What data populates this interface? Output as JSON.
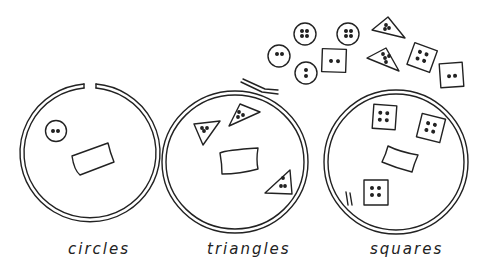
{
  "diagram": {
    "title": "",
    "rings": [
      {
        "id": "circles",
        "label": "circles",
        "contents": [
          "circle button (2 holes)",
          "blank card"
        ],
        "ring_state": "open gap at top"
      },
      {
        "id": "triangles",
        "label": "triangles",
        "contents": [
          "triangle button (3 holes)",
          "triangle button (3 holes)",
          "triangle button (3 holes)",
          "blank card"
        ],
        "ring_state": "overlapping ends at top"
      },
      {
        "id": "squares",
        "label": "squares",
        "contents": [
          "square button (4 holes)",
          "square button (4 holes)",
          "square button (4 holes)",
          "blank card"
        ],
        "ring_state": "overlapping ends at lower left"
      }
    ],
    "loose_buttons": [
      {
        "shape": "circle",
        "holes": 4
      },
      {
        "shape": "circle",
        "holes": 4
      },
      {
        "shape": "circle",
        "holes": 2
      },
      {
        "shape": "circle",
        "holes": 2
      },
      {
        "shape": "square",
        "holes": 2
      },
      {
        "shape": "triangle",
        "holes": 3
      },
      {
        "shape": "triangle",
        "holes": 4
      },
      {
        "shape": "square",
        "holes": 4
      },
      {
        "shape": "square",
        "holes": 2
      }
    ],
    "colors": {
      "ink": "#222222",
      "background": "#ffffff"
    }
  }
}
